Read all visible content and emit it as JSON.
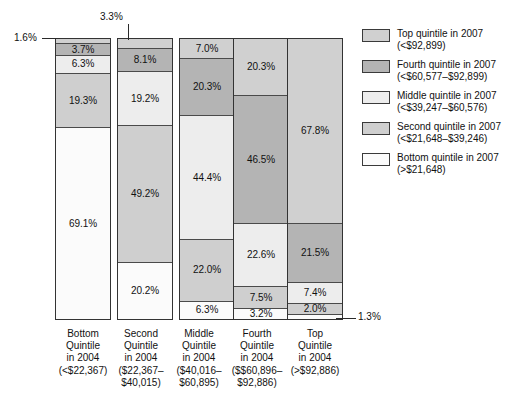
{
  "chart_data": {
    "type": "bar",
    "title": "",
    "subtitle": "",
    "xlabel": "",
    "ylabel": "",
    "ylim": [
      0,
      100
    ],
    "grid": false,
    "stacked": true,
    "units": "percent",
    "legend_position": "right",
    "categories": [
      "Bottom Quintile in 2004 (<$22,367)",
      "Second Quintile in 2004 ($22,367-$40,015)",
      "Middle Quintile in 2004 ($40,016-$60,895)",
      "Fourth Quintile in 2004 ($$60,896-$92,886)",
      "Top Quintile in 2004 (>$92,886)"
    ],
    "series": [
      {
        "name": "Top quintile in 2007 (<$92,899)",
        "key": "q5",
        "color": "#d0d0d0",
        "values": [
          1.6,
          3.3,
          7.0,
          20.3,
          67.8
        ]
      },
      {
        "name": "Fourth quintile in 2007 (<$60,577-$92,899)",
        "key": "q4",
        "color": "#b4b4b4",
        "values": [
          3.7,
          8.1,
          20.3,
          46.5,
          21.5
        ]
      },
      {
        "name": "Middle quintile in 2007 (<$39,247-$60,576)",
        "key": "q3",
        "color": "#ededed",
        "values": [
          6.3,
          19.2,
          44.4,
          22.6,
          7.4
        ]
      },
      {
        "name": "Second quintile in 2007 (<$21,648-$39,246)",
        "key": "q2",
        "color": "#cfcfcf",
        "values": [
          19.3,
          49.2,
          22.0,
          7.5,
          2.0
        ]
      },
      {
        "name": "Bottom quintile in 2007 (>$21,648)",
        "key": "q1",
        "color": "#fbfbfb",
        "values": [
          69.1,
          20.2,
          6.3,
          3.2,
          1.3
        ]
      }
    ]
  },
  "bars": [
    {
      "id": "bottom-quintile-2004",
      "segments": [
        {
          "key": "q5",
          "value": 1.6,
          "label": "1.6%",
          "inline": false
        },
        {
          "key": "q4",
          "value": 3.7,
          "label": "3.7%",
          "inline": true
        },
        {
          "key": "q3",
          "value": 6.3,
          "label": "6.3%",
          "inline": true
        },
        {
          "key": "q2",
          "value": 19.3,
          "label": "19.3%",
          "inline": true
        },
        {
          "key": "q1",
          "value": 69.1,
          "label": "69.1%",
          "inline": true
        }
      ]
    },
    {
      "id": "second-quintile-2004",
      "segments": [
        {
          "key": "q5",
          "value": 3.3,
          "label": "3.3%",
          "inline": false
        },
        {
          "key": "q4",
          "value": 8.1,
          "label": "8.1%",
          "inline": true
        },
        {
          "key": "q3",
          "value": 19.2,
          "label": "19.2%",
          "inline": true
        },
        {
          "key": "q2",
          "value": 49.2,
          "label": "49.2%",
          "inline": true
        },
        {
          "key": "q1",
          "value": 20.2,
          "label": "20.2%",
          "inline": true
        }
      ]
    },
    {
      "id": "middle-quintile-2004",
      "segments": [
        {
          "key": "q5",
          "value": 7.0,
          "label": "7.0%",
          "inline": true
        },
        {
          "key": "q4",
          "value": 20.3,
          "label": "20.3%",
          "inline": true
        },
        {
          "key": "q3",
          "value": 44.4,
          "label": "44.4%",
          "inline": true
        },
        {
          "key": "q2",
          "value": 22.0,
          "label": "22.0%",
          "inline": true
        },
        {
          "key": "q1",
          "value": 6.3,
          "label": "6.3%",
          "inline": true
        }
      ]
    },
    {
      "id": "fourth-quintile-2004",
      "segments": [
        {
          "key": "q5",
          "value": 20.3,
          "label": "20.3%",
          "inline": true
        },
        {
          "key": "q4",
          "value": 46.5,
          "label": "46.5%",
          "inline": true
        },
        {
          "key": "q3",
          "value": 22.6,
          "label": "22.6%",
          "inline": true
        },
        {
          "key": "q2",
          "value": 7.5,
          "label": "7.5%",
          "inline": true
        },
        {
          "key": "q1",
          "value": 3.2,
          "label": "3.2%",
          "inline": true
        }
      ]
    },
    {
      "id": "top-quintile-2004",
      "segments": [
        {
          "key": "q5",
          "value": 67.8,
          "label": "67.8%",
          "inline": true
        },
        {
          "key": "q4",
          "value": 21.5,
          "label": "21.5%",
          "inline": true
        },
        {
          "key": "q3",
          "value": 7.4,
          "label": "7.4%",
          "inline": true
        },
        {
          "key": "q2",
          "value": 2.0,
          "label": "2.0%",
          "inline": true
        },
        {
          "key": "q1",
          "value": 1.3,
          "label": "1.3%",
          "inline": false
        }
      ]
    }
  ],
  "callouts": {
    "bar1_top": "1.6%",
    "bar2_top": "3.3%",
    "bar5_bottom": "1.3%"
  },
  "axis_labels": [
    {
      "l1": "Bottom",
      "l2": "Quintile",
      "l3": "in 2004",
      "l4": "(<$22,367)",
      "l5": ""
    },
    {
      "l1": "Second",
      "l2": "Quintile",
      "l3": "in 2004",
      "l4": "($22,367–",
      "l5": "$40,015)"
    },
    {
      "l1": "Middle",
      "l2": "Quintile",
      "l3": "in 2004",
      "l4": "($40,016–",
      "l5": "$60,895)"
    },
    {
      "l1": "Fourth",
      "l2": "Quintile",
      "l3": "in 2004",
      "l4": "($$60,896–",
      "l5": "$92,886)"
    },
    {
      "l1": "Top",
      "l2": "Quintile",
      "l3": "in 2004",
      "l4": "(>$92,886)",
      "l5": ""
    }
  ],
  "legend": {
    "items": [
      {
        "key": "q5",
        "color": "#d0d0d0",
        "line1": "Top quintile in 2007",
        "line2": "(<$92,899)"
      },
      {
        "key": "q4",
        "color": "#b4b4b4",
        "line1": "Fourth quintile in 2007",
        "line2": "(<$60,577–$92,899)"
      },
      {
        "key": "q3",
        "color": "#ededed",
        "line1": "Middle quintile in 2007",
        "line2": "(<$39,247–$60,576)"
      },
      {
        "key": "q2",
        "color": "#cfcfcf",
        "line1": "Second quintile in 2007",
        "line2": "(<$21,648–$39,246)"
      },
      {
        "key": "q1",
        "color": "#fbfbfb",
        "line1": "Bottom quintile in 2007",
        "line2": "(>$21,648)"
      }
    ]
  }
}
